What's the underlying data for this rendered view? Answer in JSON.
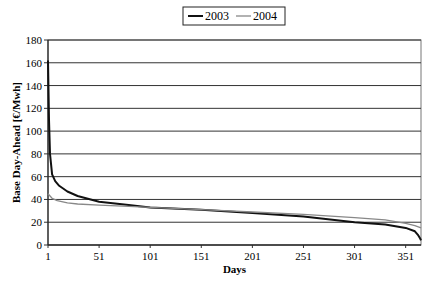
{
  "chart_data": {
    "type": "line",
    "title": "",
    "xlabel": "Days",
    "ylabel": "Base Day-Ahead [€/Mwh]",
    "xlim": [
      1,
      366
    ],
    "ylim": [
      0,
      180
    ],
    "x_ticks": [
      "1",
      "51",
      "101",
      "151",
      "201",
      "251",
      "301",
      "351"
    ],
    "y_ticks": [
      "0",
      "20",
      "40",
      "60",
      "80",
      "100",
      "120",
      "140",
      "160",
      "180"
    ],
    "grid": "horizontal",
    "legend_position": "top",
    "series": [
      {
        "name": "2003",
        "color": "#111111",
        "x": [
          1,
          2,
          3,
          5,
          8,
          12,
          20,
          30,
          51,
          80,
          101,
          151,
          201,
          251,
          301,
          331,
          351,
          360,
          363,
          365,
          366
        ],
        "values": [
          162,
          110,
          80,
          62,
          56,
          52,
          47,
          43,
          38,
          35,
          33,
          31,
          28,
          25,
          20,
          18,
          15,
          12,
          9,
          6,
          4
        ]
      },
      {
        "name": "2004",
        "color": "#888888",
        "x": [
          1,
          5,
          10,
          20,
          30,
          51,
          80,
          101,
          151,
          201,
          251,
          301,
          331,
          351,
          360,
          366
        ],
        "values": [
          45,
          41,
          39,
          37,
          36,
          35,
          34,
          33,
          31,
          29,
          27,
          24,
          22,
          19,
          17,
          15
        ]
      }
    ]
  },
  "legend": {
    "items": [
      "2003",
      "2004"
    ]
  },
  "axes": {
    "xlabel": "Days",
    "ylabel": "Base Day-Ahead [€/Mwh]"
  }
}
